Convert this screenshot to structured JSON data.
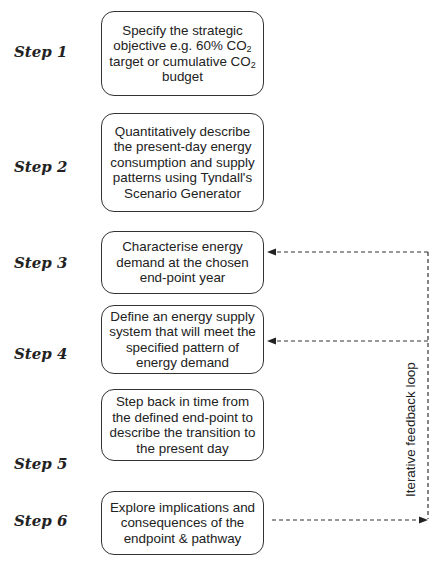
{
  "steps": [
    {
      "label": "Step 1",
      "lines": [
        "Specify the strategic",
        "objective e.g. 60% CO",
        "target or cumulative CO",
        "budget"
      ],
      "subscript": "2"
    },
    {
      "label": "Step 2",
      "lines": [
        "Quantitatively describe",
        "the present-day energy",
        "consumption and supply",
        "patterns using Tyndall's",
        "Scenario Generator"
      ]
    },
    {
      "label": "Step 3",
      "lines": [
        "Characterise energy",
        "demand at the chosen",
        "end-point year"
      ]
    },
    {
      "label": "Step 4",
      "lines": [
        "Define an energy supply",
        "system that will meet the",
        "specified pattern of",
        "energy demand"
      ]
    },
    {
      "label": "Step 5",
      "lines": [
        "Step back in time from",
        "the defined end-point to",
        "describe the transition to",
        "the present day"
      ]
    },
    {
      "label": "Step 6",
      "lines": [
        "Explore implications and",
        "consequences of the",
        "endpoint & pathway"
      ]
    }
  ],
  "feedback_loop": {
    "label": "Iterative feedback loop"
  }
}
